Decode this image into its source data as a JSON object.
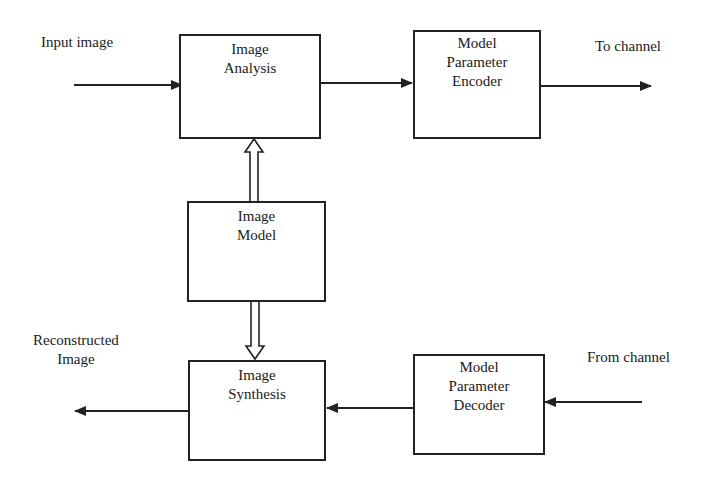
{
  "diagram": {
    "title": "",
    "blocks": {
      "analysis": {
        "lines": [
          "Image",
          "Analysis"
        ]
      },
      "encoder": {
        "lines": [
          "Model",
          "Parameter",
          "Encoder"
        ]
      },
      "model": {
        "lines": [
          "Image",
          "Model"
        ]
      },
      "synthesis": {
        "lines": [
          "Image",
          "Synthesis"
        ]
      },
      "decoder": {
        "lines": [
          "Model",
          "Parameter",
          "Decoder"
        ]
      }
    },
    "labels": {
      "input": "Input image",
      "to_channel": "To channel",
      "reconstructed": [
        "Reconstructed",
        "Image"
      ],
      "from_channel": "From channel"
    },
    "edges": [
      {
        "from": "Input image",
        "to": "Image Analysis",
        "style": "solid-arrow"
      },
      {
        "from": "Image Analysis",
        "to": "Model Parameter Encoder",
        "style": "solid-arrow"
      },
      {
        "from": "Model Parameter Encoder",
        "to": "To channel",
        "style": "solid-arrow"
      },
      {
        "from": "Image Model",
        "to": "Image Analysis",
        "style": "hollow-double-arrow"
      },
      {
        "from": "Image Model",
        "to": "Image Synthesis",
        "style": "hollow-double-arrow"
      },
      {
        "from": "From channel",
        "to": "Model Parameter Decoder",
        "style": "solid-arrow"
      },
      {
        "from": "Model Parameter Decoder",
        "to": "Image Synthesis",
        "style": "solid-arrow"
      },
      {
        "from": "Image Synthesis",
        "to": "Reconstructed Image",
        "style": "solid-arrow"
      }
    ],
    "colors": {
      "line": "#222222",
      "background": "#ffffff"
    }
  }
}
